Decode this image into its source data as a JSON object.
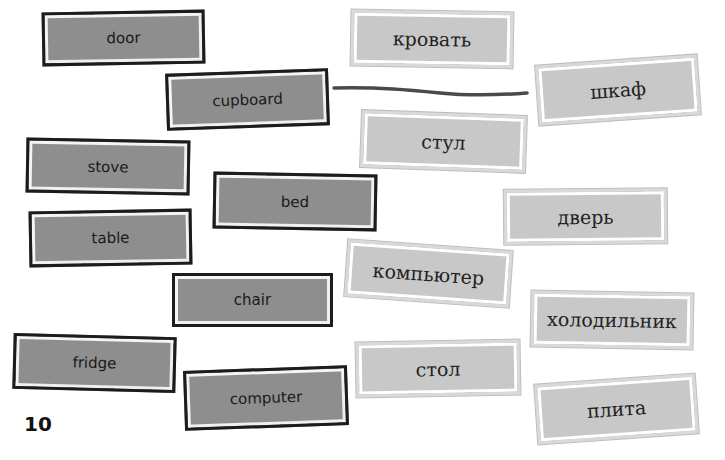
{
  "exercise": {
    "english_words": [
      {
        "label": "door"
      },
      {
        "label": "cupboard"
      },
      {
        "label": "stove"
      },
      {
        "label": "bed"
      },
      {
        "label": "table"
      },
      {
        "label": "chair"
      },
      {
        "label": "fridge"
      },
      {
        "label": "computer"
      }
    ],
    "russian_words": [
      {
        "label": "кровать"
      },
      {
        "label": "шкаф"
      },
      {
        "label": "стул"
      },
      {
        "label": "дверь"
      },
      {
        "label": "компьютер"
      },
      {
        "label": "холодильник"
      },
      {
        "label": "стол"
      },
      {
        "label": "плита"
      }
    ],
    "example_match": {
      "from": "cupboard",
      "to": "шкаф"
    }
  },
  "page_number": "10",
  "colors": {
    "english_card_fill": "#8e8e8e",
    "russian_card_fill": "#c8c8c8",
    "connector_line": "#4a4a4a"
  }
}
